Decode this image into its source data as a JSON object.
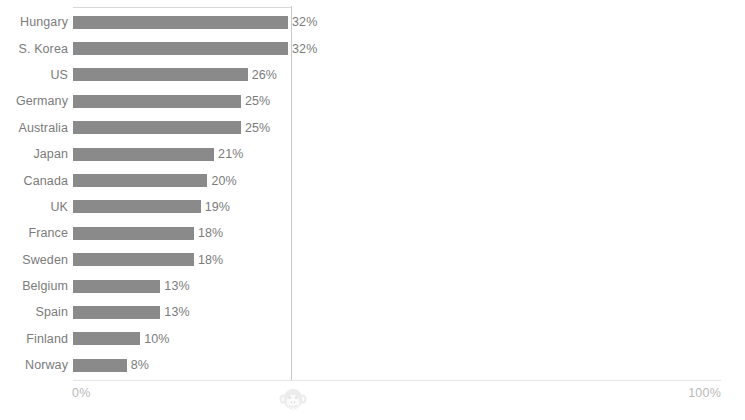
{
  "chart_data": {
    "type": "bar",
    "orientation": "horizontal",
    "title": "",
    "xlabel": "",
    "ylabel": "",
    "xlim": [
      0,
      100
    ],
    "grid": true,
    "gridline_at": 32.5,
    "axis_ticks": [
      "0%",
      "100%"
    ],
    "categories": [
      "Hungary",
      "S. Korea",
      "US",
      "Germany",
      "Australia",
      "Japan",
      "Canada",
      "UK",
      "France",
      "Sweden",
      "Belgium",
      "Spain",
      "Finland",
      "Norway"
    ],
    "values": [
      32,
      32,
      26,
      25,
      25,
      21,
      20,
      19,
      18,
      18,
      13,
      13,
      10,
      8
    ],
    "value_labels": [
      "32%",
      "32%",
      "26%",
      "25%",
      "25%",
      "21%",
      "20%",
      "19%",
      "18%",
      "18%",
      "13%",
      "13%",
      "10%",
      "8%"
    ],
    "bar_color": "#8a8a8a",
    "label_color": "#7b7b7b",
    "tick_color": "#b9b9b9",
    "gridline_color": "#c9c9c9",
    "axis_color": "#e6e6e6"
  },
  "axis": {
    "min_label": "0%",
    "max_label": "100%"
  },
  "watermark": {
    "icon": "monkey-face-icon"
  }
}
